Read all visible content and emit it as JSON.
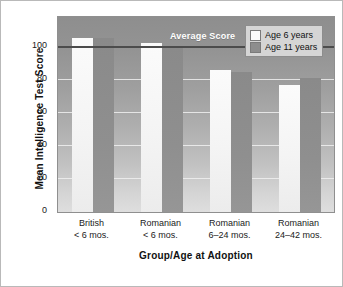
{
  "chart_data": {
    "type": "bar",
    "title": "",
    "xlabel": "Group/Age at Adoption",
    "ylabel": "Mean Intelligence Test Score",
    "ylim": [
      0,
      118
    ],
    "yticks": [
      0,
      20,
      40,
      60,
      80,
      100
    ],
    "ytick_labels": [
      "0",
      "20",
      "40",
      "60",
      "80",
      "100"
    ],
    "grid": true,
    "legend_position": "top-right",
    "categories": [
      {
        "line1": "British",
        "line2": "< 6 mos."
      },
      {
        "line1": "Romanian",
        "line2": "< 6 mos."
      },
      {
        "line1": "Romanian",
        "line2": "6–24 mos."
      },
      {
        "line1": "Romanian",
        "line2": "24–42 mos."
      }
    ],
    "series": [
      {
        "name": "Age 6 years",
        "color": "#fbfbfb",
        "values": [
          105,
          102,
          86,
          77
        ]
      },
      {
        "name": "Age 11 years",
        "color": "#8d8d8d",
        "values": [
          105,
          100,
          85,
          81
        ]
      }
    ],
    "reference_line": {
      "label": "Average Score",
      "value": 100,
      "color": "#4c4c4c"
    }
  },
  "legend": {
    "items": [
      {
        "label": "Age 6 years",
        "swatch": "light"
      },
      {
        "label": "Age 11 years",
        "swatch": "dark"
      }
    ]
  },
  "axes": {
    "y_title": "Mean Intelligence Test Score",
    "x_title": "Group/Age at Adoption"
  },
  "annotations": {
    "average_score": "Average Score"
  }
}
